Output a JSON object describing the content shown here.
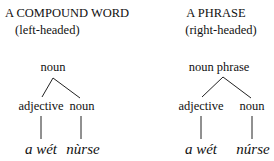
{
  "diagrams": [
    {
      "title": "A COMPOUND WORD",
      "subtitle": "(left-headed)",
      "root": "noun",
      "children": [
        {
          "label": "adjective",
          "word": "a wét"
        },
        {
          "label": "noun",
          "word": "nùrse"
        }
      ]
    },
    {
      "title": "A PHRASE",
      "subtitle": "(right-headed)",
      "root": "noun phrase",
      "children": [
        {
          "label": "adjective",
          "word": "a wét"
        },
        {
          "label": "noun",
          "word": "núrse"
        }
      ]
    }
  ]
}
